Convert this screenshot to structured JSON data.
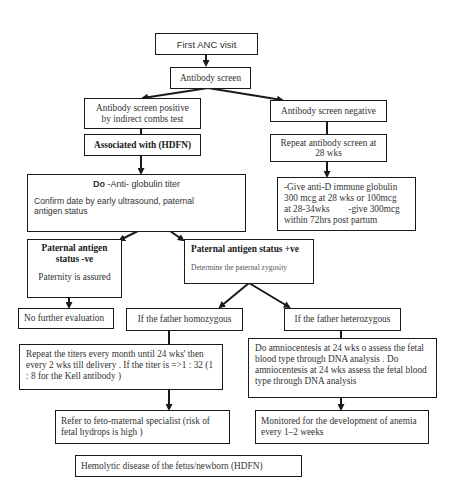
{
  "flowchart": {
    "first_visit": "First ANC visit",
    "antibody_screen": "Antibody screen",
    "positive": {
      "line1": "Antibody screen positive",
      "line2": "by indirect combs test"
    },
    "negative": "Antibody screen negative",
    "associated": "Associated with (HDFN)",
    "repeat_screen": {
      "line1": "Repeat antibody screen at",
      "line2": "28 wks"
    },
    "titer": {
      "title_bold": "Do",
      "title_rest": " -Anti- globulin titer",
      "body": "Confirm date by early ultrasound, paternal antigen status"
    },
    "anti_d": {
      "line1": "-Give anti-D immune globulin",
      "line2": "300 mcg at 28 wks or 100mcg",
      "line3": "at 28-34wks        -give 300mcg",
      "line4": "within 72hrs post partum"
    },
    "paternal_neg": {
      "title1": "Paternal antigen",
      "title2": "status -ve",
      "body": "Paternity is assured"
    },
    "paternal_pos": {
      "title": "Paternal antigen status +ve",
      "body": "Determine the paternal zygosity"
    },
    "no_further": "No further evaluation",
    "homozygous": "If the father homozygous",
    "heterozygous": "If the father heterozygous",
    "repeat_titers": "Repeat the titers every month until 24 wks' then every 2 wks till delivery . If the titer is =>1 : 32 (1 : 8 for the Kell antibody )",
    "amnio": "Do amniocentesis at 24 wks o assess the fetal blood type through DNA analysis . Do amniocentesis at 24 wks  assess the fetal blood type through DNA analysis",
    "refer": "Refer to feto-maternal specialist (risk of fetal hydrops is high )",
    "monitored": "Monitored for the development of anemia every 1–2 weeks",
    "caption": "Hemolytic disease of the fetus/newborn (HDFN)"
  },
  "colors": {
    "line": "#1a1a1a",
    "text": "#333333",
    "background": "#ffffff"
  }
}
